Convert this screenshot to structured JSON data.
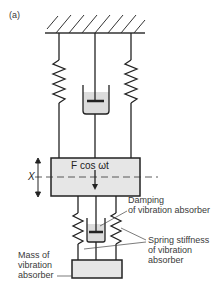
{
  "figure": {
    "panel_label": "(a)",
    "force_label": "F cos ωt",
    "displacement_label": "X",
    "annotations": {
      "damping": [
        "Damping",
        "of vibration absorber"
      ],
      "spring": [
        "Spring stiffness",
        "of vibration",
        "absorber"
      ],
      "mass": [
        "Mass of",
        "vibration",
        "absorber"
      ]
    },
    "colors": {
      "line": "#222222",
      "fill_mass": "#e6e6e6",
      "fill_fluid": "#dcdcdc",
      "text": "#3a3a3a"
    }
  }
}
